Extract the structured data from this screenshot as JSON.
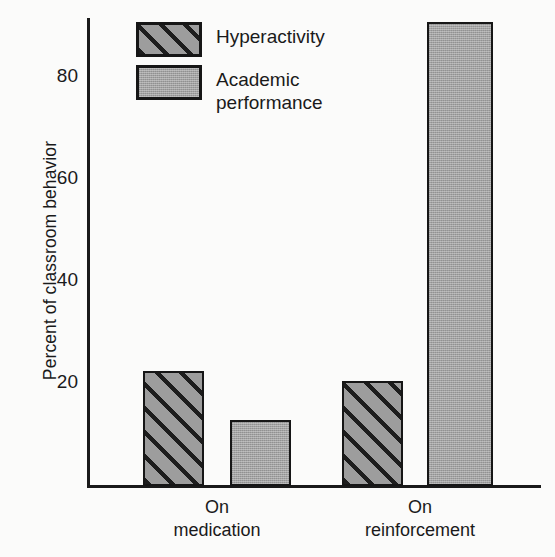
{
  "chart_data": {
    "type": "bar",
    "title": "",
    "xlabel": "",
    "ylabel": "Percent of classroom behavior",
    "ylim": [
      0,
      95
    ],
    "yticks": [
      20,
      40,
      60,
      80
    ],
    "ytick_labels": [
      "20",
      "40",
      "60",
      "80"
    ],
    "grid": false,
    "legend_position": "top-left",
    "categories": [
      "On\nmedication",
      "On\nreinforcement"
    ],
    "series": [
      {
        "name": "Hyperactivity",
        "fill": "diagonal-hatch",
        "values": [
          22.5,
          20.5
        ]
      },
      {
        "name": "Academic\nperformance",
        "fill": "solid-gray",
        "values": [
          13,
          91
        ]
      }
    ]
  },
  "axis": {
    "y_title": "Percent of classroom behavior",
    "tick_80": "80",
    "tick_60": "60",
    "tick_40": "40",
    "tick_20": "20"
  },
  "legend": {
    "items": [
      {
        "label": "Hyperactivity",
        "swatch": "hatched-swatch"
      },
      {
        "label": "Academic\nperformance",
        "swatch": "solid-gray-swatch"
      }
    ]
  },
  "xaxis": {
    "group1": "On\nmedication",
    "group2": "On\nreinforcement"
  },
  "colors": {
    "ink": "#1a1a1a",
    "bar_gray": "#a2a2a2",
    "hatch_line": "#1d1d1d",
    "background": "#fbfbfa"
  }
}
